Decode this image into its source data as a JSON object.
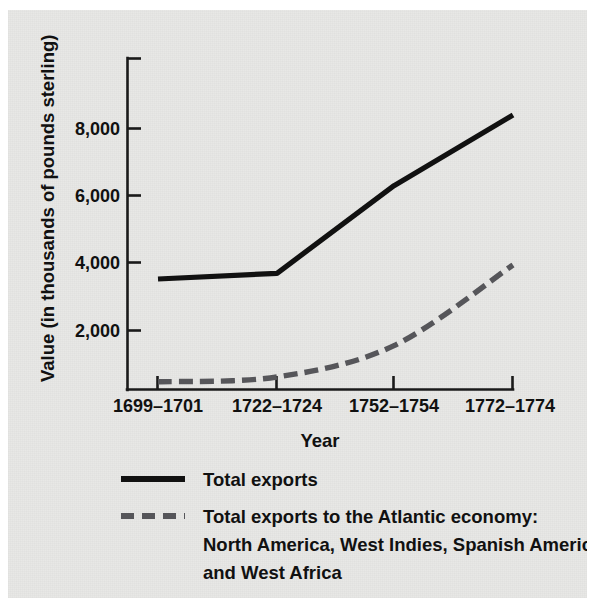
{
  "figure": {
    "background_color": "#e8e8e6",
    "ink_color": "#111111"
  },
  "chart_data": {
    "type": "line",
    "title": "",
    "subtitle": "",
    "xlabel": "Year",
    "ylabel": "Value (in thousands of pounds sterling)",
    "categories": [
      "1699–1701",
      "1722–1724",
      "1752–1754",
      "1772–1774"
    ],
    "yticks": [
      "2,000",
      "4,000",
      "6,000",
      "8,000"
    ],
    "ytick_values": [
      2000,
      4000,
      6000,
      8000
    ],
    "ylim": [
      0,
      9400
    ],
    "xlim_categories": 4,
    "grid": false,
    "legend_position": "below-axes-left",
    "series": [
      {
        "name": "Total exports",
        "style": "solid",
        "color": "#111111",
        "values": [
          3530,
          3700,
          6300,
          8400
        ]
      },
      {
        "name": "Total exports to the Atlantic economy: North America, West Indies, Spanish America, and West Africa",
        "style": "dashed",
        "color": "#56565a",
        "values": [
          475,
          620,
          1550,
          3950
        ]
      }
    ]
  },
  "axes": {
    "y_title": "Value (in thousands of pounds sterling)",
    "x_title": "Year",
    "x_tick_labels": [
      "1699–1701",
      "1722–1724",
      "1752–1754",
      "1772–1774"
    ],
    "y_tick_labels": [
      "8,000",
      "6,000",
      "4,000",
      "2,000"
    ]
  },
  "legend": {
    "items": [
      {
        "style": "solid",
        "color": "#111111",
        "lines": [
          "Total exports"
        ]
      },
      {
        "style": "dashed",
        "color": "#56565a",
        "lines": [
          "Total exports to the Atlantic economy:",
          "North America, West Indies, Spanish America,",
          "and West Africa"
        ]
      }
    ]
  }
}
